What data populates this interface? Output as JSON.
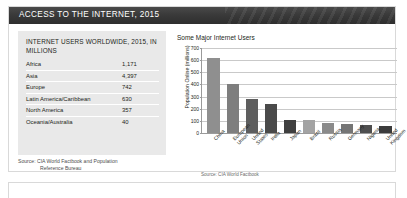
{
  "header": {
    "title": "ACCESS TO THE INTERNET, 2015",
    "bar_color": "#333333"
  },
  "left_panel": {
    "title": "INTERNET USERS WORLDWIDE, 2015, IN MILLIONS",
    "background": "#e9e9e9",
    "rows": [
      {
        "region": "Africa",
        "users": "1,171"
      },
      {
        "region": "Asia",
        "users": "4,397"
      },
      {
        "region": "Europe",
        "users": "742"
      },
      {
        "region": "Latin America/Caribbean",
        "users": "630"
      },
      {
        "region": "North America",
        "users": "357"
      },
      {
        "region": "Oceania/Australia",
        "users": "40"
      }
    ],
    "source_line1": "Source: CIA World Factbook and Population",
    "source_line2": "Reference Bureau"
  },
  "chart_panel": {
    "source": "Source: CIA World Factbook"
  },
  "chart_data": {
    "type": "bar",
    "title": "Some Major Internet Users",
    "xlabel": "",
    "ylabel": "Population Online (millions)",
    "ylim": [
      0,
      700
    ],
    "ytick_step": 100,
    "yticks": [
      "0",
      "100",
      "200",
      "300",
      "400",
      "500",
      "600",
      "700"
    ],
    "grid": true,
    "legend": "none",
    "categories": [
      "China",
      "European Union",
      "United States",
      "India",
      "Japan",
      "Brazil",
      "Russia",
      "Germany",
      "Nigeria",
      "United Kingdom"
    ],
    "values": [
      620,
      400,
      280,
      243,
      110,
      108,
      84,
      72,
      70,
      60
    ],
    "bar_colors": [
      "#8f8f8f",
      "#7e7e7e",
      "#5e5e5e",
      "#4a4a4a",
      "#3f3f3f",
      "#a3a3a3",
      "#8a8a8a",
      "#757575",
      "#4f4f4f",
      "#3b3b3b"
    ]
  }
}
